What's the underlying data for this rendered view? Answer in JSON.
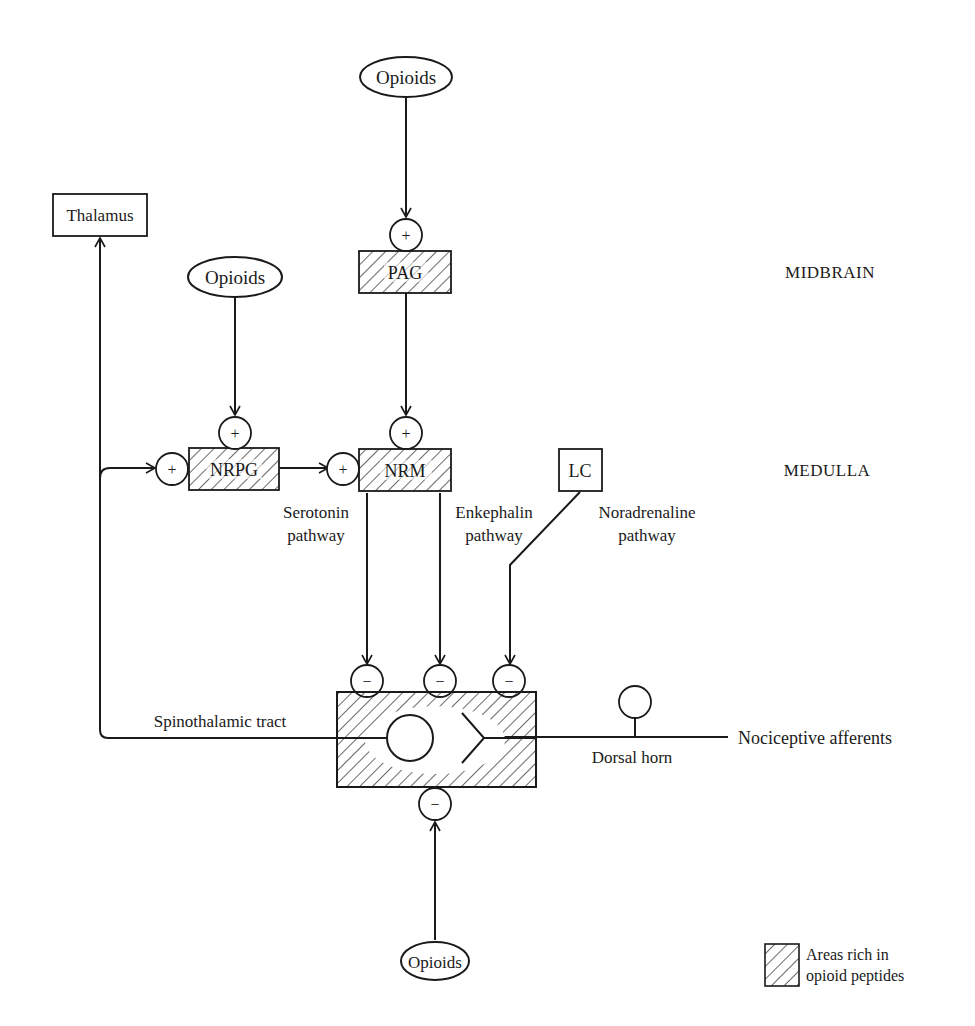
{
  "diagram": {
    "regions": {
      "midbrain": "MIDBRAIN",
      "medulla": "MEDULLA"
    },
    "nodes": {
      "opioids_top": "Opioids",
      "opioids_mid": "Opioids",
      "opioids_bottom": "Opioids",
      "thalamus": "Thalamus",
      "pag": "PAG",
      "nrpg": "NRPG",
      "nrm": "NRM",
      "lc": "LC"
    },
    "signs": {
      "plus": "+",
      "minus": "−"
    },
    "pathways": {
      "serotonin_1": "Serotonin",
      "serotonin_2": "pathway",
      "enkephalin_1": "Enkephalin",
      "enkephalin_2": "pathway",
      "noradrenaline_1": "Noradrenaline",
      "noradrenaline_2": "pathway"
    },
    "labels": {
      "spinothalamic": "Spinothalamic tract",
      "dorsal_horn": "Dorsal horn",
      "nociceptive": "Nociceptive afferents"
    },
    "legend": {
      "line1": "Areas rich in",
      "line2": "opioid peptides"
    }
  }
}
